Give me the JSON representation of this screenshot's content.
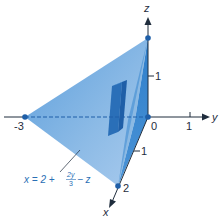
{
  "diagram": {
    "type": "3d-plane-intercepts",
    "axes": {
      "x_label": "x",
      "y_label": "y",
      "z_label": "z"
    },
    "ticks": {
      "origin": "0",
      "y_neg3": "-3",
      "y_1": "1",
      "z_1": "1",
      "x_1": "1",
      "x_2": "2"
    },
    "equation": {
      "lhs": "x = 2 +",
      "frac_num": "2y",
      "frac_den": "3",
      "rhs": "− z"
    },
    "points": [
      {
        "name": "x-intercept",
        "coords": [
          2,
          0,
          0
        ]
      },
      {
        "name": "y-intercept",
        "coords": [
          0,
          -3,
          0
        ]
      },
      {
        "name": "z-intercept",
        "coords": [
          0,
          0,
          2
        ]
      },
      {
        "name": "origin",
        "coords": [
          0,
          0,
          0
        ]
      }
    ],
    "colors": {
      "plane_light": "#7fb2e0",
      "plane_dark": "#3f88cf",
      "plane_side": "#2f79c4",
      "dot": "#1f5fa8",
      "axis": "#1f2d3d",
      "label_blue": "#2a6fb5"
    }
  }
}
